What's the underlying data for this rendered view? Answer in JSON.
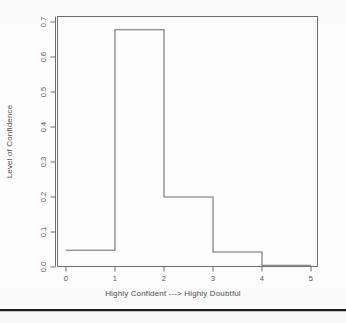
{
  "chart_data": {
    "type": "bar",
    "title": "",
    "subtitle": "",
    "xlabel": "Highly Confident ---> Highly Doubtful",
    "ylabel": "Level of Confidence",
    "xlim": [
      0,
      5
    ],
    "ylim": [
      0.0,
      0.72
    ],
    "grid": false,
    "legend": "none",
    "style": "step-outline histogram (R base graphics)",
    "line_color": "#6e6e6e",
    "bin_edges": [
      0,
      1,
      2,
      3,
      4,
      5
    ],
    "categories": [
      "0-1",
      "1-2",
      "2-3",
      "3-4",
      "4-5"
    ],
    "values": [
      0.048,
      0.678,
      0.2,
      0.043,
      0.005
    ],
    "xticks": [
      0,
      1,
      2,
      3,
      4,
      5
    ],
    "xtick_labels": [
      "0",
      "1",
      "2",
      "3",
      "4",
      "5"
    ],
    "yticks": [
      0.0,
      0.1,
      0.2,
      0.3,
      0.4,
      0.5,
      0.6,
      0.7
    ],
    "ytick_labels": [
      "0.0",
      "0.1",
      "0.2",
      "0.3",
      "0.4",
      "0.5",
      "0.6",
      "0.7"
    ]
  },
  "figure": {
    "axis_box": true,
    "bottom_rule": true
  }
}
